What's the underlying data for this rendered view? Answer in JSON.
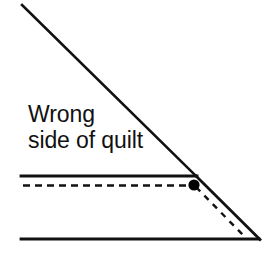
{
  "figure": {
    "background_color": "#ffffff",
    "line_color": "#111111",
    "dot_color": "#000000",
    "width": 277,
    "height": 255
  },
  "labels": {
    "line1": "Wrong",
    "line2": "side of quilt"
  },
  "shapes": {
    "fold_diagonal": {
      "name": "fold-diagonal-line",
      "style": "solid",
      "x1": 22,
      "y1": 5,
      "x2": 196,
      "y2": 176
    },
    "binding_edge_top": {
      "name": "binding-top-edge-line",
      "style": "solid",
      "x1": 21,
      "y1": 176,
      "x2": 197,
      "y2": 176
    },
    "stitch_line": {
      "name": "stitching-dashed-line",
      "style": "dashed",
      "x1": 23,
      "y1": 185,
      "x2": 191,
      "y2": 185
    },
    "binding_edge_bottom": {
      "name": "binding-bottom-edge-line",
      "style": "solid",
      "x1": 21,
      "y1": 239,
      "x2": 259,
      "y2": 239
    },
    "corner_diagonal": {
      "name": "corner-diagonal-line",
      "style": "solid",
      "x1": 196,
      "y1": 176,
      "x2": 260,
      "y2": 239
    },
    "corner_stitch_diagonal": {
      "name": "corner-stitch-dashed-line",
      "style": "dashed",
      "x1": 196,
      "y1": 187,
      "x2": 243,
      "y2": 235
    },
    "pivot_dot": {
      "name": "pivot-point-dot",
      "cx": 194,
      "cy": 185,
      "r": 5.5
    }
  }
}
